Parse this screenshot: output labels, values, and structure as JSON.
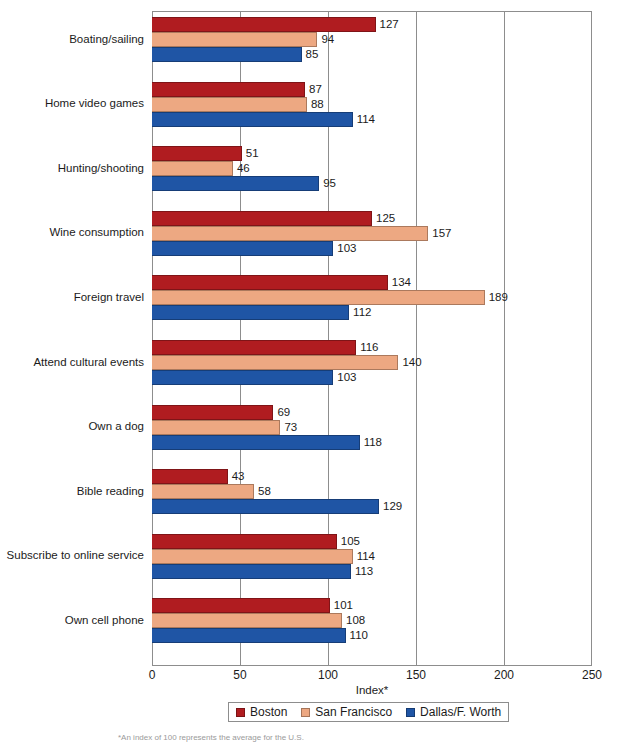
{
  "chart_data": {
    "type": "bar",
    "orientation": "horizontal",
    "title": "",
    "xlabel": "Index*",
    "ylabel": "",
    "xlim": [
      0,
      250
    ],
    "xticks": [
      0,
      50,
      100,
      150,
      200,
      250
    ],
    "grid": true,
    "legend_position": "bottom",
    "categories": [
      "Boating/sailing",
      "Home video games",
      "Hunting/shooting",
      "Wine consumption",
      "Foreign travel",
      "Attend cultural events",
      "Own a dog",
      "Bible reading",
      "Subscribe to online service",
      "Own cell phone"
    ],
    "series": [
      {
        "name": "Boston",
        "color": "#b01c20",
        "values": [
          127,
          87,
          51,
          125,
          134,
          116,
          69,
          43,
          105,
          101
        ]
      },
      {
        "name": "San Francisco",
        "color": "#eda882",
        "values": [
          94,
          88,
          46,
          157,
          189,
          140,
          73,
          58,
          114,
          108
        ]
      },
      {
        "name": "Dallas/F. Worth",
        "color": "#1f55a5",
        "values": [
          85,
          114,
          95,
          103,
          112,
          103,
          118,
          129,
          113,
          110
        ]
      }
    ],
    "footnote": "*An index of 100 represents the average for the U.S."
  }
}
